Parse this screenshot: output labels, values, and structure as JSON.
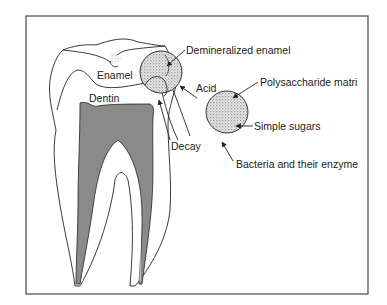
{
  "diagram": {
    "labels": {
      "enamel": "Enamel",
      "dentin": "Dentin",
      "demineralized_enamel": "Demineralized enamel",
      "acid": "Acid",
      "decay": "Decay",
      "polysaccharide_matrix": "Polysaccharide matri",
      "simple_sugars": "Simple sugars",
      "bacteria_enzymes": "Bacteria and their enzyme"
    },
    "colors": {
      "stroke": "#222222",
      "pulp_fill": "#8a8a8a",
      "stipple": "#555555",
      "frame": "#555555"
    }
  }
}
